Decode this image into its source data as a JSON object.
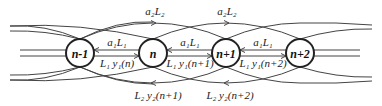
{
  "diagram": {
    "type": "chain-coupling-diagram",
    "nodes": [
      {
        "label": "n-1",
        "cx": 80,
        "cy": 53
      },
      {
        "label": "n",
        "cx": 153,
        "cy": 53
      },
      {
        "label": "n+1",
        "cx": 226,
        "cy": 53
      },
      {
        "label": "n+2",
        "cx": 300,
        "cy": 53
      }
    ],
    "node_radius": 14,
    "labels": {
      "top_a2L2_1": "a₂L₂",
      "top_a2L2_2": "a₂L₂",
      "a1L1_1": "a₁L₁",
      "a1L1_2": "a₁L₁",
      "a1L1_3": "a₁L₁",
      "L1y1_n": "L₁ y₁(n)",
      "L1y1_n1": "L₁ y₁(n+1)",
      "L1y1_n2": "L₁ y₁(n+2)",
      "L2y2_n1": "L₂ y₂(n+1)",
      "L2y2_n2": "L₂ y₂(n+2)"
    },
    "colors": {
      "stroke": "#444444",
      "node_stroke": "#222222",
      "background": "#ffffff"
    }
  }
}
